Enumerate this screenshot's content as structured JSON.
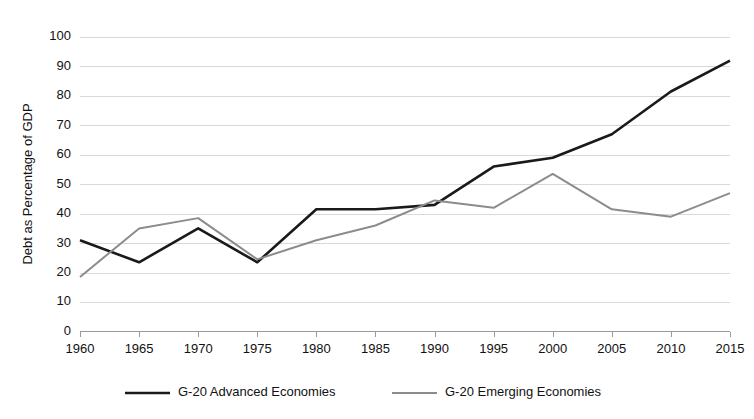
{
  "chart_data": {
    "type": "line",
    "title": "",
    "xlabel": "",
    "ylabel": "Debt as Percentage of GDP",
    "x": [
      1960,
      1965,
      1970,
      1975,
      1980,
      1985,
      1990,
      1995,
      2000,
      2005,
      2010,
      2015
    ],
    "xtick_labels": [
      "1960",
      "1965",
      "1970",
      "1975",
      "1980",
      "1985",
      "1990",
      "1995",
      "2000",
      "2005",
      "2010",
      "2015"
    ],
    "ytick_labels": [
      "0",
      "10",
      "20",
      "30",
      "40",
      "50",
      "60",
      "70",
      "80",
      "90",
      "100"
    ],
    "yticks": [
      0,
      10,
      20,
      30,
      40,
      50,
      60,
      70,
      80,
      90,
      100
    ],
    "ylim": [
      0,
      100
    ],
    "xlim": [
      1960,
      2015
    ],
    "grid": true,
    "legend_position": "bottom",
    "series": [
      {
        "name": "G-20 Advanced Economies",
        "color": "#1a1a1a",
        "width": 2.6,
        "values": [
          31,
          23.5,
          35,
          23.5,
          41.5,
          41.5,
          43,
          56,
          59,
          67,
          81.5,
          92
        ]
      },
      {
        "name": "G-20 Emerging Economies",
        "color": "#8c8c8c",
        "width": 2.0,
        "values": [
          18.5,
          35,
          38.5,
          24.5,
          31,
          36,
          44.5,
          42,
          53.5,
          41.5,
          39,
          47
        ]
      }
    ]
  },
  "legend": {
    "items": [
      {
        "label": "G-20 Advanced Economies",
        "color": "#1a1a1a"
      },
      {
        "label": "G-20 Emerging Economies",
        "color": "#8c8c8c"
      }
    ]
  }
}
